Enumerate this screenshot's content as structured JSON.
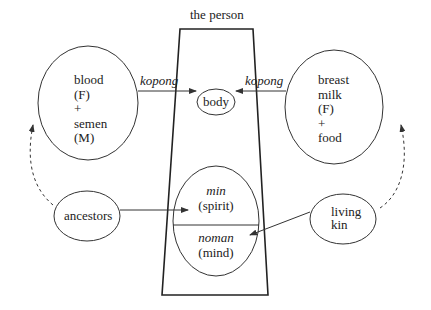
{
  "title": "the person",
  "nodes": {
    "left_source": {
      "lines": [
        "blood",
        "(F)",
        "+",
        "semen",
        "(M)"
      ]
    },
    "right_source": {
      "lines": [
        "breast",
        "milk",
        "(F)",
        "+",
        "food"
      ]
    },
    "body": {
      "label": "body"
    },
    "spirit": {
      "term": "min",
      "gloss": "(spirit)"
    },
    "mind": {
      "term": "noman",
      "gloss": "(mind)"
    },
    "ancestors": {
      "label": "ancestors"
    },
    "living_kin": {
      "lines": [
        "living",
        "kin"
      ]
    }
  },
  "edges": {
    "left_to_body": {
      "label": "kopong"
    },
    "right_to_body": {
      "label": "kopong"
    }
  },
  "colors": {
    "stroke": "#333333",
    "text": "#222222",
    "background": "#ffffff"
  }
}
